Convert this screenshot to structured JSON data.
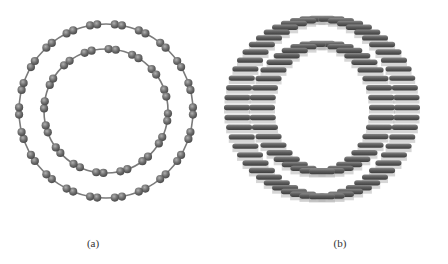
{
  "figure": {
    "panels": [
      {
        "id": "a",
        "label": "(a)",
        "view": "end-on cross-section",
        "label_pos": [
          93,
          243
        ],
        "center": [
          106,
          111
        ],
        "rings": [
          {
            "name": "outer-tube",
            "radius": 87,
            "atom_pairs": 22
          },
          {
            "name": "inner-tube",
            "radius": 62,
            "atom_pairs": 16
          }
        ]
      },
      {
        "id": "b",
        "label": "(b)",
        "view": "perspective side view",
        "label_pos": [
          340,
          243
        ],
        "center": [
          322,
          108
        ],
        "bar_length": 26,
        "rings": [
          {
            "name": "outer-tube",
            "rx": 85,
            "ry": 89,
            "bars": 56
          },
          {
            "name": "inner-tube",
            "rx": 60,
            "ry": 64,
            "bars": 40
          }
        ]
      }
    ],
    "colors": {
      "atom": "#6f6f6f",
      "atom_highlight": "#a8a8a8",
      "atom_shadow": "#4a4a4a",
      "bond": "#7a7a7a",
      "bond_fill": "#9a9a9a",
      "background": "#ffffff"
    }
  }
}
